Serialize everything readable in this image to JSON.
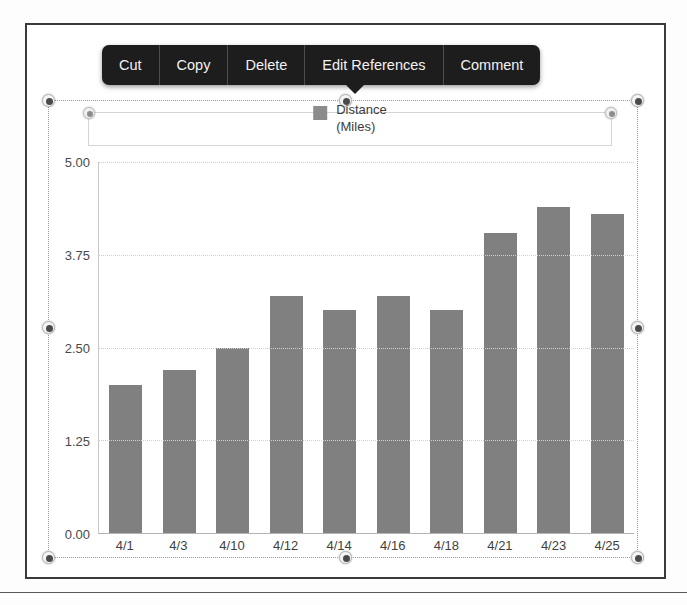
{
  "context_menu": {
    "items": [
      {
        "label": "Cut",
        "name": "menu-item-cut"
      },
      {
        "label": "Copy",
        "name": "menu-item-copy"
      },
      {
        "label": "Delete",
        "name": "menu-item-delete"
      },
      {
        "label": "Edit References",
        "name": "menu-item-edit-references"
      },
      {
        "label": "Comment",
        "name": "menu-item-comment"
      }
    ]
  },
  "legend": {
    "line1": "Distance",
    "line2": "(Miles)",
    "swatch_color": "#8c8c8c"
  },
  "colors": {
    "bar": "#808080",
    "grid": "#d0d0d0",
    "axis": "#b4b4b4",
    "menu_background": "#1d1d1d",
    "menu_text": "#f2f2f2",
    "frame": "#3a3a3a"
  },
  "chart_data": {
    "type": "bar",
    "title": "",
    "xlabel": "",
    "ylabel": "",
    "legend": [
      "Distance (Miles)"
    ],
    "legend_position": "top",
    "grid": true,
    "ylim": [
      0,
      5
    ],
    "yticks": [
      "0.00",
      "1.25",
      "2.50",
      "3.75",
      "5.00"
    ],
    "ytick_values": [
      0,
      1.25,
      2.5,
      3.75,
      5
    ],
    "categories": [
      "4/1",
      "4/3",
      "4/10",
      "4/12",
      "4/14",
      "4/16",
      "4/18",
      "4/21",
      "4/23",
      "4/25"
    ],
    "values": [
      2.0,
      2.2,
      2.5,
      3.2,
      3.0,
      3.2,
      3.0,
      4.05,
      4.4,
      4.3
    ],
    "series": [
      {
        "name": "Distance (Miles)",
        "values": [
          2.0,
          2.2,
          2.5,
          3.2,
          3.0,
          3.2,
          3.0,
          4.05,
          4.4,
          4.3
        ]
      }
    ]
  }
}
